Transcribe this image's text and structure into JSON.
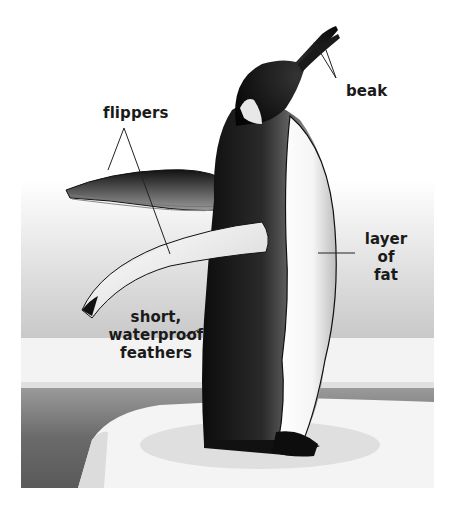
{
  "diagram": {
    "labels": {
      "beak": "beak",
      "flippers": "flippers",
      "fat_line1": "layer",
      "fat_line2": "of",
      "fat_line3": "fat",
      "feathers_line1": "short,",
      "feathers_line2": "waterproof",
      "feathers_line3": "feathers"
    },
    "colors": {
      "sky_top": "#ffffff",
      "sky_bottom": "#cfcfcf",
      "ice_band": "#f2f2f2",
      "sea_dark": "#5a5a5a",
      "sea_light": "#a8a8a8",
      "penguin_black": "#111111",
      "penguin_belly": "#f7f7f7",
      "label_text": "#1a1a1a"
    }
  }
}
